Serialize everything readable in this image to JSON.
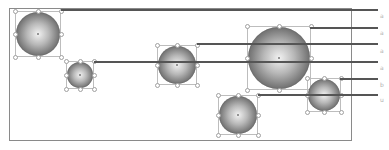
{
  "diagram": {
    "frame": {
      "x": 9,
      "y": 8,
      "w": 343,
      "h": 133
    },
    "colors": {
      "line": "#555555",
      "frame": "#8a8a8a",
      "sphere_light": "#f2f2f2",
      "sphere_dark": "#3a3a3a",
      "selection": "#bdbdbd",
      "label": "#b0b0b0"
    },
    "spheres": [
      {
        "id": "sphere-1",
        "cx": 38,
        "cy": 34,
        "r": 22
      },
      {
        "id": "sphere-2",
        "cx": 80,
        "cy": 75,
        "r": 13
      },
      {
        "id": "sphere-3",
        "cx": 177,
        "cy": 65,
        "r": 19
      },
      {
        "id": "sphere-4",
        "cx": 279,
        "cy": 58,
        "r": 31
      },
      {
        "id": "sphere-5",
        "cx": 324,
        "cy": 95,
        "r": 16
      },
      {
        "id": "sphere-6",
        "cx": 238,
        "cy": 115,
        "r": 19
      }
    ],
    "lines": [
      {
        "x1": 61,
        "x2": 378,
        "y": 10
      },
      {
        "x1": 310,
        "x2": 378,
        "y": 28
      },
      {
        "x1": 197,
        "x2": 378,
        "y": 44
      },
      {
        "x1": 94,
        "x2": 378,
        "y": 62
      },
      {
        "x1": 340,
        "x2": 378,
        "y": 79
      },
      {
        "x1": 258,
        "x2": 378,
        "y": 95
      }
    ],
    "labels": [
      {
        "text": "a",
        "x": 380,
        "y": 16
      },
      {
        "text": "a",
        "x": 380,
        "y": 33
      },
      {
        "text": "a",
        "x": 380,
        "y": 51
      },
      {
        "text": "a",
        "x": 380,
        "y": 68
      },
      {
        "text": "b",
        "x": 380,
        "y": 85
      },
      {
        "text": "u",
        "x": 380,
        "y": 100
      }
    ]
  }
}
